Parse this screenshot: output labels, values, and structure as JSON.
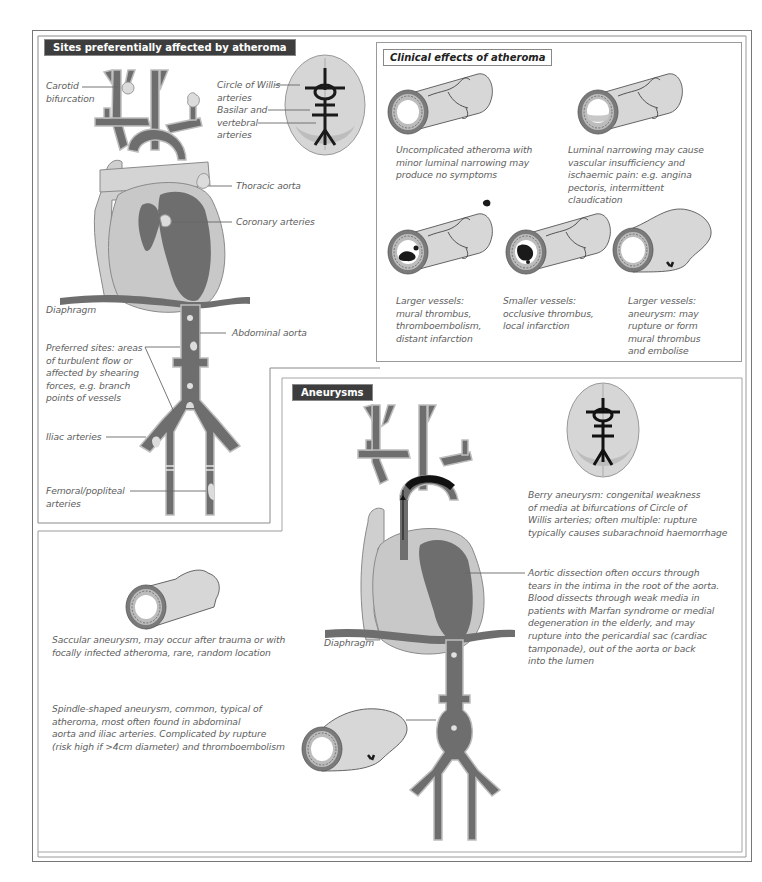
{
  "panels": {
    "sites": {
      "title": "Sites preferentially affected by atheroma",
      "labels": {
        "carotid": [
          "Carotid",
          "bifurcation"
        ],
        "willis": [
          "Circle of Willis",
          "arteries"
        ],
        "basilar": [
          "Basilar and",
          "vertebral",
          "arteries"
        ],
        "thoracic": "Thoracic aorta",
        "coronary": "Coronary arteries",
        "diaphragm": "Diaphragm",
        "abdominal": "Abdominal aorta",
        "preferred": [
          "Preferred sites: areas",
          "of turbulent flow or",
          "affected by shearing",
          "forces, e.g. branch",
          "points of vessels"
        ],
        "iliac": "Iliac arteries",
        "femoral": [
          "Femoral/popliteal",
          "arteries"
        ]
      }
    },
    "clinical": {
      "title": "Clinical effects of atheroma",
      "items": [
        {
          "id": "uncomplicated",
          "text": [
            "Uncomplicated atheroma with",
            "minor luminal narrowing may",
            "produce no symptoms"
          ]
        },
        {
          "id": "narrowing",
          "text": [
            "Luminal narrowing may cause",
            "vascular insufficiency and",
            "ischaemic pain: e.g. angina",
            "pectoris, intermittent",
            "claudication"
          ]
        },
        {
          "id": "large-thrombus",
          "text": [
            "Larger vessels:",
            "mural thrombus,",
            "thromboembolism,",
            "distant infarction"
          ]
        },
        {
          "id": "small-thrombus",
          "text": [
            "Smaller vessels:",
            "occlusive thrombus,",
            "local infarction"
          ]
        },
        {
          "id": "large-aneurysm",
          "text": [
            "Larger vessels:",
            "aneurysm: may",
            "rupture or form",
            "mural thrombus",
            "and embolise"
          ]
        }
      ]
    },
    "aneurysms": {
      "title": "Aneurysms",
      "berry": [
        "Berry aneurysm: congenital weakness",
        "of media at bifurcations of Circle of",
        "Willis arteries; often multiple: rupture",
        "typically causes subarachnoid haemorrhage"
      ],
      "dissection": [
        "Aortic dissection often occurs through",
        "tears in the intima in the root of the aorta.",
        "Blood dissects through weak media in",
        "patients with Marfan syndrome or medial",
        "degeneration in the elderly, and may",
        "rupture into the pericardial sac (cardiac",
        "tamponade), out of the aorta or back",
        "into the lumen"
      ],
      "diaphragm": "Diaphragm",
      "saccular": [
        "Saccular aneurysm, may occur after trauma or with",
        "focally infected atheroma, rare, random location"
      ],
      "spindle": [
        "Spindle-shaped aneurysm, common, typical of",
        "atheroma, most often found in abdominal",
        "aorta and iliac arteries.  Complicated by rupture",
        "(risk high if >4cm diameter) and thromboembolism"
      ]
    }
  },
  "colors": {
    "title_bg": "#3d3d3d",
    "artery": "#6e6e6e",
    "artery_wall": "#bdbdbd",
    "tissue": "#cfcfcf",
    "plaque": "#d9d9d9",
    "thrombus": "#1a1a1a",
    "border": "#777777"
  }
}
